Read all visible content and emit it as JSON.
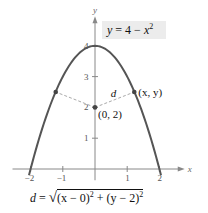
{
  "chart_data": {
    "type": "line",
    "title": "",
    "xlabel": "x",
    "ylabel": "y",
    "xlim": [
      -2.5,
      2.6
    ],
    "ylim": [
      -0.3,
      4.7
    ],
    "x_ticks": [
      -2,
      -1,
      1,
      2
    ],
    "x_tick_labels": [
      "−2",
      "−1",
      "1",
      "2"
    ],
    "y_ticks": [
      1,
      2,
      3,
      4
    ],
    "y_tick_labels": [
      "1",
      "2",
      "3",
      "4"
    ],
    "grid": false,
    "series": [
      {
        "name": "y = 4 − x²",
        "function": "4 - x^2",
        "x_range": [
          -2.05,
          2.05
        ],
        "color": "#555555"
      }
    ],
    "points": [
      {
        "name": "center",
        "x": 0,
        "y": 2,
        "label": "(0, 2)"
      },
      {
        "name": "curve-point-right",
        "x": 1.22,
        "y": 2.5,
        "label": "(x, y)"
      },
      {
        "name": "curve-point-left",
        "x": -1.22,
        "y": 2.5,
        "label": ""
      }
    ],
    "dashed_segments": [
      {
        "from": [
          0,
          2
        ],
        "to": [
          1.22,
          2.5
        ],
        "label": "d"
      },
      {
        "from": [
          0,
          2
        ],
        "to": [
          -1.22,
          2.5
        ],
        "label": ""
      }
    ],
    "annotations": {
      "equation": "y = 4 − x²",
      "distance_formula": "d = √((x − 0)² + (y − 2)²)"
    },
    "colors": {
      "curve": "#555555",
      "axes": "#888888",
      "dashed": "#aaaaaa",
      "point": "#444444",
      "equation_bg": "#ececec"
    }
  },
  "labels": {
    "equation_y": "y",
    "equation_eq": " = 4 − ",
    "equation_x": "x",
    "equation_sup": "2",
    "d_label": "d",
    "point_xy": "(x, y)",
    "point_center": "(0, 2)",
    "formula_d": "d",
    "formula_eq": " = ",
    "formula_root": "√",
    "formula_body_1": "(x − 0)",
    "formula_sup_1": "2",
    "formula_plus": " + ",
    "formula_body_2": "(y − 2)",
    "formula_sup_2": "2"
  }
}
